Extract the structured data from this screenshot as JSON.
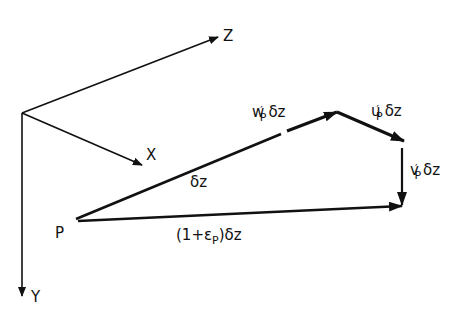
{
  "diagram": {
    "axes": {
      "z_label": "Z",
      "x_label": "X",
      "y_label": "Y"
    },
    "point_label": "P",
    "vectors": {
      "dz": {
        "label": "δz"
      },
      "w": {
        "label_main": "w",
        "label_prime": "′",
        "label_sub": "P",
        "label_tail": "δz"
      },
      "u": {
        "label_main": "u",
        "label_prime": "′",
        "label_sub": "P",
        "label_tail": "δz"
      },
      "v": {
        "label_main": "v",
        "label_prime": "′",
        "label_sub": "P",
        "label_tail": "δz"
      },
      "stretched": {
        "label_pre": "(1+ε",
        "label_sub": "P",
        "label_post": ")δz"
      }
    },
    "colors": {
      "line": "#111111",
      "background": "#ffffff"
    }
  }
}
